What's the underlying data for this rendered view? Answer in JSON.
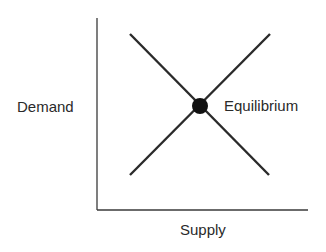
{
  "diagram": {
    "type": "supply-demand",
    "labels": {
      "y_axis": "Demand",
      "x_axis": "Supply",
      "intersection": "Equilibrium"
    },
    "colors": {
      "line": "#2a2a2a",
      "axis": "#3a3a3a",
      "point": "#111111",
      "background": "#ffffff"
    },
    "elements": [
      {
        "name": "demand-curve",
        "shape": "line",
        "from": [
          130,
          34
        ],
        "to": [
          269,
          175
        ]
      },
      {
        "name": "supply-curve",
        "shape": "line",
        "from": [
          130,
          175
        ],
        "to": [
          270,
          34
        ]
      },
      {
        "name": "equilibrium-point",
        "shape": "circle",
        "center": [
          200,
          106
        ],
        "radius": 8
      }
    ]
  }
}
